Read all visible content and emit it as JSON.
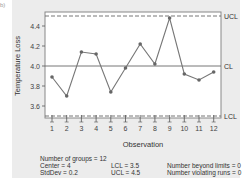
{
  "chart_data": {
    "type": "line",
    "title": "",
    "xlabel": "Observation",
    "ylabel": "Temperature Loss",
    "x": [
      1,
      2,
      3,
      4,
      5,
      6,
      7,
      8,
      9,
      10,
      11,
      12
    ],
    "series": [
      {
        "name": "Temperature Loss",
        "values": [
          3.89,
          3.7,
          4.14,
          4.12,
          3.74,
          3.98,
          4.22,
          4.02,
          4.48,
          3.92,
          3.86,
          3.94
        ]
      }
    ],
    "yticks": [
      "3.6",
      "3.8",
      "4.0",
      "4.2",
      "4.4"
    ],
    "xticks": [
      "1",
      "2",
      "3",
      "4",
      "5",
      "6",
      "7",
      "8",
      "9",
      "10",
      "11",
      "12"
    ],
    "ylim": [
      3.49,
      4.54
    ],
    "control_lines": [
      {
        "label": "UCL",
        "value": 4.5,
        "style": "dashed"
      },
      {
        "label": "CL",
        "value": 4.0,
        "style": "solid"
      },
      {
        "label": "LCL",
        "value": 3.5,
        "style": "dashed"
      }
    ],
    "grid": false,
    "legend": "none"
  },
  "stats": {
    "groups": "Number of groups = 12",
    "center": "Center = 4",
    "stddev": "StdDev = 0.2",
    "lcl": "LCL = 3.5",
    "ucl": "UCL = 4.5",
    "beyond": "Number beyond limits = 0",
    "violating": "Number violating runs = 0"
  },
  "corner_label": "b)"
}
